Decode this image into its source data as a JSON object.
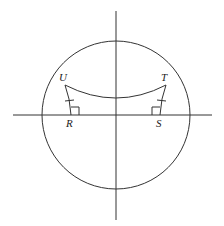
{
  "diagram": {
    "type": "geometry",
    "axes": {
      "horizontal": {
        "x1": 13,
        "y1": 115,
        "x2": 212,
        "y2": 115
      },
      "vertical": {
        "x1": 116,
        "y1": 11,
        "x2": 116,
        "y2": 220
      }
    },
    "circle": {
      "cx": 116,
      "cy": 115,
      "r": 74
    },
    "points": {
      "U": {
        "label": "U",
        "x": 65,
        "y": 85
      },
      "T": {
        "label": "T",
        "x": 166,
        "y": 85
      },
      "R": {
        "label": "R",
        "x": 71,
        "y": 115
      },
      "S": {
        "label": "S",
        "x": 160,
        "y": 115
      }
    },
    "arc_UT": {
      "from": "U",
      "to": "T",
      "lowest_y": 98
    },
    "congruence_marks": [
      "UR",
      "TS"
    ],
    "right_angles": [
      "R",
      "S"
    ],
    "colors": {
      "stroke": "#333333",
      "background": "#ffffff"
    }
  }
}
